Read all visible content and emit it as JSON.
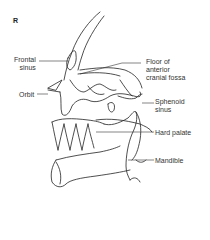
{
  "panel_label": "R",
  "labels": {
    "frontal_sinus": "Frontal\nsinus",
    "orbit": "Orbit",
    "floor_anterior_cranial_fossa": "Floor of\nanterior\ncranial fossa",
    "sphenoid_sinus": "Sphenoid\nsinus",
    "hard_palate": "Hard palate",
    "mandible": "Mandible"
  }
}
